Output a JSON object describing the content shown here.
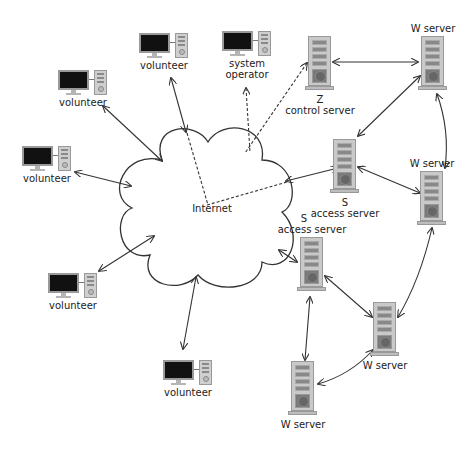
{
  "diagram": {
    "cloud_label": "Internet",
    "colors": {
      "line": "#333333",
      "cloud_stroke": "#333333",
      "monitor": "#111111",
      "case": "#c9c9c9"
    },
    "volunteers": [
      {
        "id": "v1",
        "label": "volunteer",
        "x": 139,
        "y": 33
      },
      {
        "id": "v2",
        "label": "volunteer",
        "x": 58,
        "y": 70
      },
      {
        "id": "v3",
        "label": "volunteer",
        "x": 22,
        "y": 146
      },
      {
        "id": "v4",
        "label": "volunteer",
        "x": 48,
        "y": 273
      },
      {
        "id": "v5",
        "label": "volunteer",
        "x": 163,
        "y": 360
      }
    ],
    "operator": {
      "label_line1": "system",
      "label_line2": "operator",
      "x": 222,
      "y": 31
    },
    "servers": [
      {
        "id": "z",
        "letter": "Z",
        "label": "control server",
        "x": 305,
        "y": 36,
        "label_pos": "below"
      },
      {
        "id": "w1",
        "letter": "",
        "label": "W server",
        "x": 418,
        "y": 36,
        "label_pos": "above"
      },
      {
        "id": "s1",
        "letter": "S",
        "label": "access server",
        "x": 330,
        "y": 139,
        "label_pos": "below"
      },
      {
        "id": "w2",
        "letter": "",
        "label": "W server",
        "x": 417,
        "y": 171,
        "label_pos": "above"
      },
      {
        "id": "s2",
        "letter": "S",
        "label": "access server",
        "x": 297,
        "y": 237,
        "label_pos": "above"
      },
      {
        "id": "w3",
        "letter": "",
        "label": "W server",
        "x": 370,
        "y": 302,
        "label_pos": "below"
      },
      {
        "id": "w4",
        "letter": "",
        "label": "W server",
        "x": 288,
        "y": 361,
        "label_pos": "below"
      }
    ],
    "edges": [
      {
        "from": "v1",
        "to": "cloud",
        "style": "solid",
        "points": [
          171,
          78,
          186,
          132
        ]
      },
      {
        "from": "v2",
        "to": "cloud",
        "style": "solid",
        "points": [
          103,
          106,
          162,
          161
        ]
      },
      {
        "from": "v3",
        "to": "cloud",
        "style": "solid",
        "points": [
          75,
          172,
          131,
          186
        ]
      },
      {
        "from": "v4",
        "to": "cloud",
        "style": "solid",
        "points": [
          99,
          271,
          154,
          236
        ]
      },
      {
        "from": "v5",
        "to": "cloud",
        "style": "solid",
        "points": [
          183,
          349,
          196,
          277
        ]
      },
      {
        "from": "s1",
        "to": "cloud",
        "style": "solid",
        "points": [
          286,
          181,
          338,
          168
        ]
      },
      {
        "from": "s2",
        "to": "cloud",
        "style": "solid",
        "points": [
          279,
          250,
          297,
          262
        ]
      },
      {
        "from": "z",
        "to": "w1",
        "style": "solid",
        "points": [
          333,
          62,
          418,
          62
        ]
      },
      {
        "from": "w1",
        "to": "s1",
        "style": "solid",
        "points": [
          420,
          76,
          358,
          136
        ]
      },
      {
        "from": "w1",
        "to": "w2",
        "style": "curve",
        "points": [
          437,
          94,
          450,
          130,
          445,
          168
        ]
      },
      {
        "from": "s1",
        "to": "w2",
        "style": "solid",
        "points": [
          358,
          167,
          420,
          193
        ]
      },
      {
        "from": "w2",
        "to": "w3",
        "style": "curve",
        "points": [
          432,
          228,
          420,
          280,
          398,
          317
        ]
      },
      {
        "from": "s2",
        "to": "w3",
        "style": "solid",
        "points": [
          325,
          276,
          372,
          317
        ]
      },
      {
        "from": "s2",
        "to": "w4",
        "style": "solid",
        "points": [
          310,
          297,
          305,
          360
        ]
      },
      {
        "from": "w3",
        "to": "w4",
        "style": "curve",
        "points": [
          373,
          350,
          350,
          375,
          318,
          384
        ]
      },
      {
        "from": "operator",
        "to": "cloud",
        "style": "dashed",
        "points": [
          246,
          88,
          250,
          152
        ]
      },
      {
        "from": "z",
        "to": "cloud",
        "style": "dashed",
        "points": [
          307,
          63,
          245,
          153
        ]
      },
      {
        "from": "cloud",
        "to": "v1",
        "style": "dashed",
        "points": [
          187,
          133,
          208,
          205
        ]
      },
      {
        "from": "cloud",
        "to": "s1",
        "style": "dashed",
        "points": [
          207,
          205,
          287,
          182
        ]
      }
    ]
  }
}
